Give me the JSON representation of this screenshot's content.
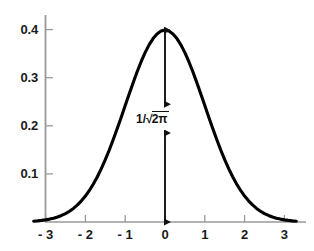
{
  "chart_data": {
    "type": "line",
    "title": "",
    "subtitle": "",
    "xlabel": "",
    "ylabel": "",
    "xlim": [
      -3.35,
      3.45
    ],
    "ylim": [
      0,
      0.455
    ],
    "grid": false,
    "legend": null,
    "curve_color": "#000000",
    "axis_color": "#9a9a9a",
    "annotation_color": "#111111",
    "x_ticks": [
      {
        "value": -3,
        "label": "- 3"
      },
      {
        "value": -2,
        "label": "- 2"
      },
      {
        "value": -1,
        "label": "- 1"
      },
      {
        "value": 0,
        "label": "0"
      },
      {
        "value": 1,
        "label": "1"
      },
      {
        "value": 2,
        "label": "2"
      },
      {
        "value": 3,
        "label": "3"
      }
    ],
    "y_ticks": [
      {
        "value": 0.1,
        "label": "0.1"
      },
      {
        "value": 0.2,
        "label": "0.2"
      },
      {
        "value": 0.3,
        "label": "0.3"
      },
      {
        "value": 0.4,
        "label": "0.4"
      }
    ],
    "series": [
      {
        "name": "standard-normal-pdf",
        "x": [
          -3.3,
          -3.2,
          -3.1,
          -3.0,
          -2.9,
          -2.8,
          -2.7,
          -2.6,
          -2.5,
          -2.4,
          -2.3,
          -2.2,
          -2.1,
          -2.0,
          -1.9,
          -1.8,
          -1.7,
          -1.6,
          -1.5,
          -1.4,
          -1.3,
          -1.2,
          -1.1,
          -1.0,
          -0.9,
          -0.8,
          -0.7,
          -0.6,
          -0.5,
          -0.4,
          -0.3,
          -0.2,
          -0.1,
          0.0,
          0.1,
          0.2,
          0.3,
          0.4,
          0.5,
          0.6,
          0.7,
          0.8,
          0.9,
          1.0,
          1.1,
          1.2,
          1.3,
          1.4,
          1.5,
          1.6,
          1.7,
          1.8,
          1.9,
          2.0,
          2.1,
          2.2,
          2.3,
          2.4,
          2.5,
          2.6,
          2.7,
          2.8,
          2.9,
          3.0,
          3.1,
          3.2,
          3.3
        ],
        "y": [
          0.0017,
          0.0024,
          0.0033,
          0.0044,
          0.006,
          0.0079,
          0.0104,
          0.0136,
          0.0175,
          0.0224,
          0.0283,
          0.0355,
          0.044,
          0.054,
          0.0656,
          0.079,
          0.094,
          0.1109,
          0.1295,
          0.1497,
          0.1714,
          0.1942,
          0.2179,
          0.242,
          0.2661,
          0.2897,
          0.3123,
          0.3332,
          0.3521,
          0.3683,
          0.3814,
          0.391,
          0.397,
          0.3989,
          0.397,
          0.391,
          0.3814,
          0.3683,
          0.3521,
          0.3332,
          0.3123,
          0.2897,
          0.2661,
          0.242,
          0.2179,
          0.1942,
          0.1714,
          0.1497,
          0.1295,
          0.1109,
          0.094,
          0.079,
          0.0656,
          0.054,
          0.044,
          0.0355,
          0.0283,
          0.0224,
          0.0175,
          0.0136,
          0.0104,
          0.0079,
          0.006,
          0.0044,
          0.0033,
          0.0024,
          0.0017
        ]
      }
    ],
    "annotations": [
      {
        "name": "peak-height-label",
        "text_plain": "1/√2π",
        "numerator": "1",
        "slash": "/",
        "radical": "√",
        "radicand": "2π",
        "x": 0,
        "y": 0.215,
        "describes": "peak height of the standard normal density equals 1/sqrt(2*pi) ≈ 0.3989"
      }
    ],
    "arrows": [
      {
        "name": "upper-height-arrow",
        "x": 0,
        "y_from": 0.3989,
        "y_to": 0.245,
        "double_headed": true
      },
      {
        "name": "lower-height-arrow",
        "x": 0,
        "y_from": 0.185,
        "y_to": 0.0,
        "double_headed": true
      }
    ]
  }
}
